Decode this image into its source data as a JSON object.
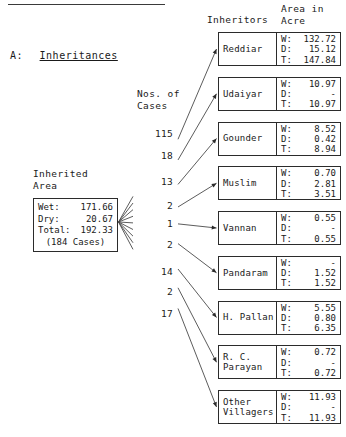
{
  "document": {
    "section_label": "A:",
    "section_title": "Inheritances"
  },
  "headers": {
    "inheritors": "Inheritors",
    "area": "Area in\nAcre",
    "area_line1": "Area in",
    "area_line2": "Acre",
    "nos_of_cases_line1": "Nos. of",
    "nos_of_cases_line2": "Cases"
  },
  "source": {
    "caption_line1": "Inherited",
    "caption_line2": "Area",
    "wet_label": "Wet:",
    "wet_value": "171.66",
    "dry_label": "Dry:",
    "dry_value": "20.67",
    "total_label": "Total:",
    "total_value": "192.33",
    "cases": "(184 Cases)"
  },
  "value_labels": {
    "wet": "W:",
    "dry": "D:",
    "total": "T:"
  },
  "chart_data": {
    "type": "diagram",
    "title": "A: Inheritances",
    "flow": "source-to-destinations",
    "source": {
      "name": "Inherited Area",
      "wet": 171.66,
      "dry": 20.67,
      "total": 192.33,
      "cases": 184
    },
    "categories": [
      "Reddiar",
      "Udaiyar",
      "Gounder",
      "Muslim",
      "Vannan",
      "Pandaram",
      "H. Pallan",
      "R. C. Parayan",
      "Other Villagers"
    ],
    "series": [
      {
        "name": "Nos. of Cases",
        "values": [
          115,
          18,
          13,
          2,
          1,
          2,
          14,
          2,
          17
        ]
      },
      {
        "name": "Wet",
        "values": [
          132.72,
          10.97,
          8.52,
          0.7,
          0.55,
          null,
          5.55,
          0.72,
          11.93
        ]
      },
      {
        "name": "Dry",
        "values": [
          15.12,
          null,
          0.42,
          2.81,
          null,
          1.52,
          0.8,
          null,
          null
        ]
      },
      {
        "name": "Total",
        "values": [
          147.84,
          10.97,
          8.94,
          3.51,
          0.55,
          1.52,
          6.35,
          0.72,
          11.93
        ]
      }
    ]
  },
  "rows": [
    {
      "name": "Reddiar",
      "name_line1": "Reddiar",
      "name_line2": "",
      "cases": "115",
      "wet": "132.72",
      "dry": "15.12",
      "total": "147.84"
    },
    {
      "name": "Udaiyar",
      "name_line1": "Udaiyar",
      "name_line2": "",
      "cases": "18",
      "wet": "10.97",
      "dry": "-",
      "total": "10.97"
    },
    {
      "name": "Gounder",
      "name_line1": "Gounder",
      "name_line2": "",
      "cases": "13",
      "wet": "8.52",
      "dry": "0.42",
      "total": "8.94"
    },
    {
      "name": "Muslim",
      "name_line1": "Muslim",
      "name_line2": "",
      "cases": "2",
      "wet": "0.70",
      "dry": "2.81",
      "total": "3.51"
    },
    {
      "name": "Vannan",
      "name_line1": "Vannan",
      "name_line2": "",
      "cases": "1",
      "wet": "0.55",
      "dry": "-",
      "total": "0.55"
    },
    {
      "name": "Pandaram",
      "name_line1": "Pandaram",
      "name_line2": "",
      "cases": "2",
      "wet": "-",
      "dry": "1.52",
      "total": "1.52"
    },
    {
      "name": "H. Pallan",
      "name_line1": "H. Pallan",
      "name_line2": "",
      "cases": "14",
      "wet": "5.55",
      "dry": "0.80",
      "total": "6.35"
    },
    {
      "name": "R. C. Parayan",
      "name_line1": "R. C.",
      "name_line2": "Parayan",
      "cases": "2",
      "wet": "0.72",
      "dry": "-",
      "total": "0.72"
    },
    {
      "name": "Other Villagers",
      "name_line1": "Other",
      "name_line2": "Villagers",
      "cases": "17",
      "wet": "11.93",
      "dry": "-",
      "total": "11.93"
    }
  ]
}
